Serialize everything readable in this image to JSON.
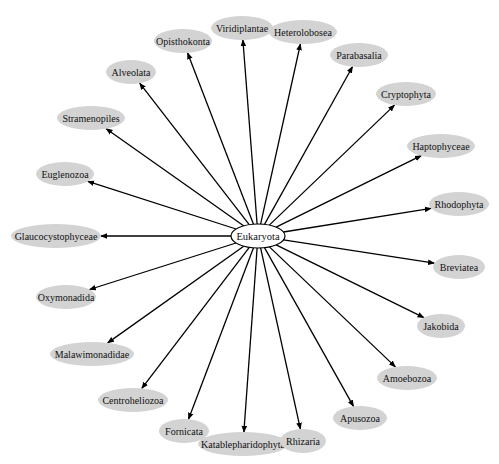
{
  "diagram": {
    "type": "radial-tree",
    "root": {
      "id": "eukaryota",
      "label": "Eukaryota",
      "cx": 258,
      "cy": 236,
      "rx": 27,
      "ry": 12,
      "fill": "#ffffff",
      "stroke": "#000000"
    },
    "node_style": {
      "fill": "#d3d3d3",
      "edge_color": "#000000"
    },
    "nodes": [
      {
        "id": "viridiplantae",
        "label": "Viridiplantae",
        "cx": 242,
        "cy": 28,
        "rx": 31,
        "ry": 12
      },
      {
        "id": "heterolobosea",
        "label": "Heterolobosea",
        "cx": 303,
        "cy": 32,
        "rx": 34,
        "ry": 12
      },
      {
        "id": "opisthokonta",
        "label": "Opisthokonta",
        "cx": 183,
        "cy": 41,
        "rx": 29,
        "ry": 12
      },
      {
        "id": "parabasalia",
        "label": "Parabasalia",
        "cx": 359,
        "cy": 55,
        "rx": 29,
        "ry": 12
      },
      {
        "id": "alveolata",
        "label": "Alveolata",
        "cx": 131,
        "cy": 72,
        "rx": 25,
        "ry": 12
      },
      {
        "id": "cryptophyta",
        "label": "Cryptophyta",
        "cx": 406,
        "cy": 94,
        "rx": 30,
        "ry": 12
      },
      {
        "id": "stramenopiles",
        "label": "Stramenopiles",
        "cx": 91,
        "cy": 118,
        "rx": 34,
        "ry": 12
      },
      {
        "id": "haptophyceae",
        "label": "Haptophyceae",
        "cx": 441,
        "cy": 146,
        "rx": 34,
        "ry": 12
      },
      {
        "id": "euglenozoa",
        "label": "Euglenozoa",
        "cx": 65,
        "cy": 174,
        "rx": 29,
        "ry": 12
      },
      {
        "id": "rhodophyta",
        "label": "Rhodophyta",
        "cx": 459,
        "cy": 204,
        "rx": 30,
        "ry": 12
      },
      {
        "id": "glaucocystophyceae",
        "label": "Glaucocystophyceae",
        "cx": 56,
        "cy": 236,
        "rx": 45,
        "ry": 12
      },
      {
        "id": "breviatea",
        "label": "Breviatea",
        "cx": 459,
        "cy": 267,
        "rx": 26,
        "ry": 12
      },
      {
        "id": "oxymonadida",
        "label": "Oxymonadida",
        "cx": 66,
        "cy": 297,
        "rx": 30,
        "ry": 12
      },
      {
        "id": "jakobida",
        "label": "Jakobida",
        "cx": 441,
        "cy": 326,
        "rx": 24,
        "ry": 12
      },
      {
        "id": "malawimonadidae",
        "label": "Malawimonadidae",
        "cx": 92,
        "cy": 354,
        "rx": 42,
        "ry": 12
      },
      {
        "id": "amoebozoa",
        "label": "Amoebozoa",
        "cx": 407,
        "cy": 378,
        "rx": 30,
        "ry": 12
      },
      {
        "id": "centroheliozoa",
        "label": "Centroheliozoa",
        "cx": 133,
        "cy": 400,
        "rx": 35,
        "ry": 12
      },
      {
        "id": "apusozoa",
        "label": "Apusozoa",
        "cx": 360,
        "cy": 418,
        "rx": 27,
        "ry": 12
      },
      {
        "id": "fornicata",
        "label": "Fornicata",
        "cx": 184,
        "cy": 431,
        "rx": 25,
        "ry": 12
      },
      {
        "id": "katablepharidophyta",
        "label": "Katablepharidophyta",
        "cx": 243,
        "cy": 444,
        "rx": 45,
        "ry": 12
      },
      {
        "id": "rhizaria",
        "label": "Rhizaria",
        "cx": 303,
        "cy": 441,
        "rx": 23,
        "ry": 12
      }
    ]
  }
}
